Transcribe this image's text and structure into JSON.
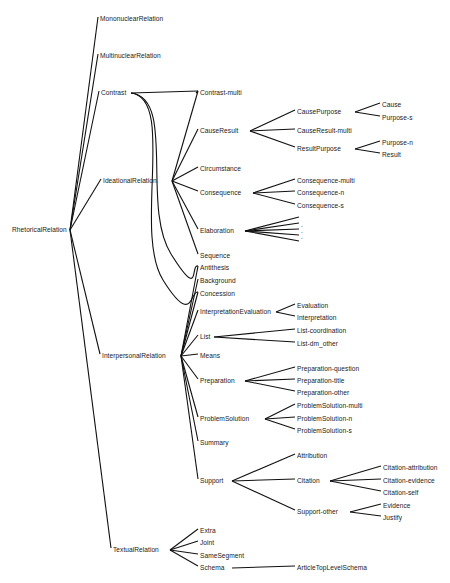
{
  "diagram": {
    "line_color": "#111111",
    "text_color": "#222222",
    "background": "#ffffff",
    "nodes": [
      {
        "id": "RhetoricalRelation",
        "label": "RhetoricalRelation",
        "x": 12,
        "y": 230,
        "hx": 70,
        "hy": 230
      },
      {
        "id": "MononuclearRelation",
        "label": "MononuclearRelation",
        "x": 100,
        "y": 19
      },
      {
        "id": "MultinuclearRelation",
        "label": "MultinuclearRelation",
        "x": 100,
        "y": 56
      },
      {
        "id": "Contrast",
        "label": "Contrast",
        "x": 101,
        "y": 93,
        "hx": 131,
        "hy": 93
      },
      {
        "id": "IdeationalRelation",
        "label": "IdeationalRelation",
        "x": 103,
        "y": 181,
        "hx": 172,
        "hy": 181
      },
      {
        "id": "InterpersonalRelation",
        "label": "InterpersonalRelation",
        "x": 102,
        "y": 356,
        "hx": 181,
        "hy": 356
      },
      {
        "id": "TextualRelation",
        "label": "TextualRelation",
        "x": 113,
        "y": 550,
        "hx": 170,
        "hy": 550
      },
      {
        "id": "Contrast-multi",
        "label": "Contrast-multi",
        "x": 200,
        "y": 93
      },
      {
        "id": "CauseResult",
        "label": "CauseResult",
        "x": 200,
        "y": 131,
        "hx": 250,
        "hy": 131
      },
      {
        "id": "Circumstance",
        "label": "Circumstance",
        "x": 200,
        "y": 169
      },
      {
        "id": "Consequence",
        "label": "Consequence",
        "x": 200,
        "y": 193,
        "hx": 253,
        "hy": 193
      },
      {
        "id": "Elaboration",
        "label": "Elaboration",
        "x": 200,
        "y": 231,
        "hx": 245,
        "hy": 231
      },
      {
        "id": "Sequence",
        "label": "Sequence",
        "x": 200,
        "y": 256
      },
      {
        "id": "Antithesis",
        "label": "Antithesis",
        "x": 200,
        "y": 268
      },
      {
        "id": "Background",
        "label": "Background",
        "x": 200,
        "y": 281
      },
      {
        "id": "Concession",
        "label": "Concession",
        "x": 200,
        "y": 294
      },
      {
        "id": "InterpretationEvaluation",
        "label": "InterpretationEvaluation",
        "x": 200,
        "y": 312,
        "hx": 276,
        "hy": 312
      },
      {
        "id": "List",
        "label": "List",
        "x": 200,
        "y": 337,
        "hx": 214,
        "hy": 337
      },
      {
        "id": "Means",
        "label": "Means",
        "x": 200,
        "y": 356
      },
      {
        "id": "Preparation",
        "label": "Preparation",
        "x": 200,
        "y": 381,
        "hx": 245,
        "hy": 381
      },
      {
        "id": "ProblemSolution",
        "label": "ProblemSolution",
        "x": 200,
        "y": 419,
        "hx": 265,
        "hy": 419
      },
      {
        "id": "Summary",
        "label": "Summary",
        "x": 200,
        "y": 443
      },
      {
        "id": "Support",
        "label": "Support",
        "x": 200,
        "y": 481,
        "hx": 232,
        "hy": 481
      },
      {
        "id": "CausePurpose",
        "label": "CausePurpose",
        "x": 297,
        "y": 112,
        "hx": 355,
        "hy": 112
      },
      {
        "id": "CauseResult-multi",
        "label": "CauseResult-multi",
        "x": 297,
        "y": 131
      },
      {
        "id": "ResultPurpose",
        "label": "ResultPurpose",
        "x": 297,
        "y": 149,
        "hx": 355,
        "hy": 149
      },
      {
        "id": "Cause",
        "label": "Cause",
        "x": 382,
        "y": 105
      },
      {
        "id": "Purpose-s",
        "label": "Purpose-s",
        "x": 382,
        "y": 118
      },
      {
        "id": "Purpose-n",
        "label": "Purpose-n",
        "x": 382,
        "y": 143
      },
      {
        "id": "Result",
        "label": "Result",
        "x": 382,
        "y": 155
      },
      {
        "id": "Consequence-multi",
        "label": "Consequence-multi",
        "x": 297,
        "y": 181
      },
      {
        "id": "Consequence-n",
        "label": "Consequence-n",
        "x": 297,
        "y": 193
      },
      {
        "id": "Consequence-s",
        "label": "Consequence-s",
        "x": 297,
        "y": 206
      },
      {
        "id": "Elab-1",
        "label": "",
        "x": 301,
        "y": 219
      },
      {
        "id": "Elab-2",
        "label": ".",
        "x": 301,
        "y": 225
      },
      {
        "id": "Elab-3",
        "label": ".",
        "x": 301,
        "y": 231
      },
      {
        "id": "Elab-4",
        "label": ".",
        "x": 301,
        "y": 237
      },
      {
        "id": "Elab-5",
        "label": "",
        "x": 301,
        "y": 243
      },
      {
        "id": "Evaluation",
        "label": "Evaluation",
        "x": 297,
        "y": 306
      },
      {
        "id": "Interpretation",
        "label": "Interpretation",
        "x": 297,
        "y": 318
      },
      {
        "id": "List-coordination",
        "label": "List-coordination",
        "x": 297,
        "y": 331
      },
      {
        "id": "List-dm_other",
        "label": "List-dm_other",
        "x": 297,
        "y": 344
      },
      {
        "id": "Preparation-question",
        "label": "Preparation-question",
        "x": 297,
        "y": 369
      },
      {
        "id": "Preparation-title",
        "label": "Preparation-title",
        "x": 297,
        "y": 381
      },
      {
        "id": "Preparation-other",
        "label": "Preparation-other",
        "x": 297,
        "y": 393
      },
      {
        "id": "ProblemSolution-multi",
        "label": "ProblemSolution-multi",
        "x": 297,
        "y": 406
      },
      {
        "id": "ProblemSolution-n",
        "label": "ProblemSolution-n",
        "x": 297,
        "y": 419
      },
      {
        "id": "ProblemSolution-s",
        "label": "ProblemSolution-s",
        "x": 297,
        "y": 431
      },
      {
        "id": "Attribution",
        "label": "Attribution",
        "x": 297,
        "y": 456
      },
      {
        "id": "Citation",
        "label": "Citation",
        "x": 297,
        "y": 481,
        "hx": 330,
        "hy": 481
      },
      {
        "id": "Support-other",
        "label": "Support-other",
        "x": 297,
        "y": 512,
        "hx": 350,
        "hy": 512
      },
      {
        "id": "Citation-attribution",
        "label": "Citation-attribution",
        "x": 383,
        "y": 468
      },
      {
        "id": "Citation-evidence",
        "label": "Citation-evidence",
        "x": 383,
        "y": 481
      },
      {
        "id": "Citation-self",
        "label": "Citation-self",
        "x": 383,
        "y": 493
      },
      {
        "id": "Evidence",
        "label": "Evidence",
        "x": 383,
        "y": 506
      },
      {
        "id": "Justify",
        "label": "Justify",
        "x": 383,
        "y": 518
      },
      {
        "id": "Extra",
        "label": "Extra",
        "x": 200,
        "y": 531
      },
      {
        "id": "Joint",
        "label": "Joint",
        "x": 200,
        "y": 543
      },
      {
        "id": "SameSegment",
        "label": "SameSegment",
        "x": 200,
        "y": 556
      },
      {
        "id": "Schema",
        "label": "Schema",
        "x": 200,
        "y": 568,
        "hx": 232,
        "hy": 568
      },
      {
        "id": "ArticleTopLevelSchema",
        "label": "ArticleTopLevelSchema",
        "x": 297,
        "y": 568
      }
    ],
    "edges": [
      [
        "RhetoricalRelation",
        "MononuclearRelation"
      ],
      [
        "RhetoricalRelation",
        "MultinuclearRelation"
      ],
      [
        "RhetoricalRelation",
        "Contrast"
      ],
      [
        "RhetoricalRelation",
        "IdeationalRelation"
      ],
      [
        "RhetoricalRelation",
        "InterpersonalRelation"
      ],
      [
        "RhetoricalRelation",
        "TextualRelation"
      ],
      [
        "Contrast",
        "Contrast-multi"
      ],
      [
        "IdeationalRelation",
        "CauseResult"
      ],
      [
        "IdeationalRelation",
        "Circumstance"
      ],
      [
        "IdeationalRelation",
        "Consequence"
      ],
      [
        "IdeationalRelation",
        "Elaboration"
      ],
      [
        "IdeationalRelation",
        "Sequence"
      ],
      [
        "IdeationalRelation",
        "Contrast-multi"
      ],
      [
        "InterpersonalRelation",
        "Background"
      ],
      [
        "InterpersonalRelation",
        "Concession"
      ],
      [
        "InterpersonalRelation",
        "Antithesis"
      ],
      [
        "InterpersonalRelation",
        "InterpretationEvaluation"
      ],
      [
        "InterpersonalRelation",
        "List"
      ],
      [
        "InterpersonalRelation",
        "Means"
      ],
      [
        "InterpersonalRelation",
        "Preparation"
      ],
      [
        "InterpersonalRelation",
        "ProblemSolution"
      ],
      [
        "InterpersonalRelation",
        "Summary"
      ],
      [
        "InterpersonalRelation",
        "Support"
      ],
      [
        "CauseResult",
        "CausePurpose"
      ],
      [
        "CauseResult",
        "CauseResult-multi"
      ],
      [
        "CauseResult",
        "ResultPurpose"
      ],
      [
        "CausePurpose",
        "Cause"
      ],
      [
        "CausePurpose",
        "Purpose-s"
      ],
      [
        "ResultPurpose",
        "Purpose-n"
      ],
      [
        "ResultPurpose",
        "Result"
      ],
      [
        "Consequence",
        "Consequence-multi"
      ],
      [
        "Consequence",
        "Consequence-n"
      ],
      [
        "Consequence",
        "Consequence-s"
      ],
      [
        "Elaboration",
        "Elab-1"
      ],
      [
        "Elaboration",
        "Elab-2"
      ],
      [
        "Elaboration",
        "Elab-3"
      ],
      [
        "Elaboration",
        "Elab-4"
      ],
      [
        "Elaboration",
        "Elab-5"
      ],
      [
        "InterpretationEvaluation",
        "Evaluation"
      ],
      [
        "InterpretationEvaluation",
        "Interpretation"
      ],
      [
        "List",
        "List-coordination"
      ],
      [
        "List",
        "List-dm_other"
      ],
      [
        "Preparation",
        "Preparation-question"
      ],
      [
        "Preparation",
        "Preparation-title"
      ],
      [
        "Preparation",
        "Preparation-other"
      ],
      [
        "ProblemSolution",
        "ProblemSolution-multi"
      ],
      [
        "ProblemSolution",
        "ProblemSolution-n"
      ],
      [
        "ProblemSolution",
        "ProblemSolution-s"
      ],
      [
        "Support",
        "Attribution"
      ],
      [
        "Support",
        "Citation"
      ],
      [
        "Support",
        "Support-other"
      ],
      [
        "Citation",
        "Citation-attribution"
      ],
      [
        "Citation",
        "Citation-evidence"
      ],
      [
        "Citation",
        "Citation-self"
      ],
      [
        "Support-other",
        "Evidence"
      ],
      [
        "Support-other",
        "Justify"
      ],
      [
        "TextualRelation",
        "Extra"
      ],
      [
        "TextualRelation",
        "Joint"
      ],
      [
        "TextualRelation",
        "SameSegment"
      ],
      [
        "TextualRelation",
        "Schema"
      ],
      [
        "Schema",
        "ArticleTopLevelSchema"
      ]
    ],
    "curved_edges": [
      [
        "Contrast",
        "Antithesis"
      ],
      [
        "Contrast",
        "Concession"
      ]
    ]
  }
}
